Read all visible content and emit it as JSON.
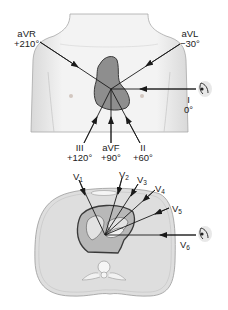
{
  "figure": {
    "frontal_view": {
      "leads": [
        {
          "name": "aVR",
          "angle": "+210°"
        },
        {
          "name": "aVL",
          "angle": "−30°"
        },
        {
          "name": "I",
          "angle": "0°"
        },
        {
          "name": "III",
          "angle": "+120°"
        },
        {
          "name": "aVF",
          "angle": "+90°"
        },
        {
          "name": "II",
          "angle": "+60°"
        }
      ]
    },
    "horizontal_view": {
      "leads": [
        {
          "name": "V",
          "sub": "1"
        },
        {
          "name": "V",
          "sub": "2"
        },
        {
          "name": "V",
          "sub": "3"
        },
        {
          "name": "V",
          "sub": "4"
        },
        {
          "name": "V",
          "sub": "5"
        },
        {
          "name": "V",
          "sub": "6"
        }
      ]
    },
    "colors": {
      "body_fill": "#efefef",
      "body_outline": "#9a9a9a",
      "heart_fill": "#8c8c8c",
      "heart_outline": "#3a3a3a",
      "cross_section_fill": "#dcdcdc",
      "line": "#1a1a1a"
    }
  }
}
